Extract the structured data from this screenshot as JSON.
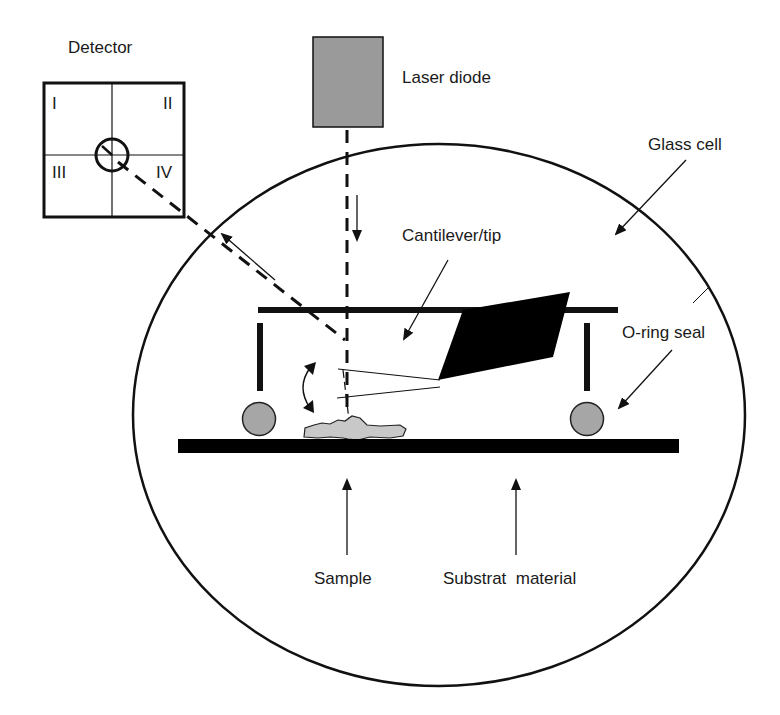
{
  "diagram": {
    "type": "schematic",
    "labels": {
      "detector": "Detector",
      "laser_diode": "Laser diode",
      "glass_cell": "Glass cell",
      "cantilever_tip": "Cantilever/tip",
      "o_ring_seal": "O-ring seal",
      "sample": "Sample",
      "substrate_material": "Substrat  material"
    },
    "detector_quadrants": [
      "I",
      "II",
      "III",
      "IV"
    ],
    "colors": {
      "stroke": "#111111",
      "laser_fill": "#9a9a9a",
      "o_ring_fill": "#a6a6a6",
      "sample_fill": "#c8c8c8",
      "cantilever_fill": "#000000",
      "background": "#ffffff"
    }
  }
}
